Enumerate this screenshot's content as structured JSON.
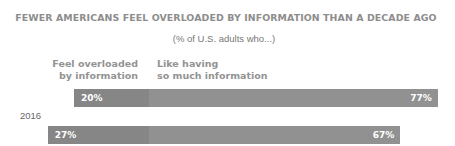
{
  "chart_data": {
    "type": "bar",
    "orientation": "horizontal",
    "stacked": true,
    "title": "FEWER AMERICANS FEEL OVERLOADED BY INFORMATION THAN A DECADE AGO",
    "subtitle": "(% of U.S. adults who...)",
    "categories": [
      "2016",
      "2006"
    ],
    "series": [
      {
        "name": "Feel overloaded by information",
        "values": [
          20,
          27
        ],
        "labels": [
          "20%",
          "27%"
        ],
        "color": "#868686"
      },
      {
        "name": "Like having so much information",
        "values": [
          77,
          67
        ],
        "labels": [
          "77%",
          "67%"
        ],
        "color": "#919191"
      }
    ],
    "xlabel": "",
    "ylabel": "",
    "grid": false,
    "legend_position": "top (inline column headers)"
  },
  "legend": {
    "left_line1": "Feel overloaded",
    "left_line2": "by information",
    "right_line1": "Like having",
    "right_line2": "so much information"
  }
}
